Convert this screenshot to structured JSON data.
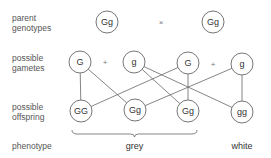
{
  "labels": {
    "parent": [
      "parent",
      "genotypes"
    ],
    "gametes": [
      "possible",
      "gametes"
    ],
    "offspring": [
      "possible",
      "offspring"
    ],
    "phenotype": "phenotype"
  },
  "parents": [
    {
      "genotype": "Gg",
      "x": 107,
      "y": 22
    },
    {
      "genotype": "Gg",
      "x": 213,
      "y": 22
    }
  ],
  "cross_symbol": "×",
  "gametes": [
    {
      "allele": "G",
      "x": 80,
      "y": 62,
      "parent": 0
    },
    {
      "allele": "g",
      "x": 134,
      "y": 62,
      "parent": 0
    },
    {
      "allele": "G",
      "x": 188,
      "y": 63,
      "parent": 1
    },
    {
      "allele": "g",
      "x": 242,
      "y": 64,
      "parent": 1
    }
  ],
  "plus_symbol": "+",
  "offspring": [
    {
      "genotype": "GG",
      "x": 81,
      "y": 111
    },
    {
      "genotype": "Gg",
      "x": 135,
      "y": 110
    },
    {
      "genotype": "Gg",
      "x": 188,
      "y": 111
    },
    {
      "genotype": "gg",
      "x": 242,
      "y": 112
    }
  ],
  "connections": [
    {
      "from_gamete": 0,
      "to_offspring": 0
    },
    {
      "from_gamete": 0,
      "to_offspring": 1
    },
    {
      "from_gamete": 1,
      "to_offspring": 2
    },
    {
      "from_gamete": 1,
      "to_offspring": 3
    },
    {
      "from_gamete": 2,
      "to_offspring": 0
    },
    {
      "from_gamete": 2,
      "to_offspring": 2
    },
    {
      "from_gamete": 3,
      "to_offspring": 1
    },
    {
      "from_gamete": 3,
      "to_offspring": 3
    }
  ],
  "phenotypes": [
    {
      "label": "grey",
      "offspring_range": [
        0,
        2
      ]
    },
    {
      "label": "white",
      "offspring_range": [
        3,
        3
      ]
    }
  ],
  "colors": {
    "stroke": "#666666",
    "text": "#333333",
    "label": "#555555"
  }
}
